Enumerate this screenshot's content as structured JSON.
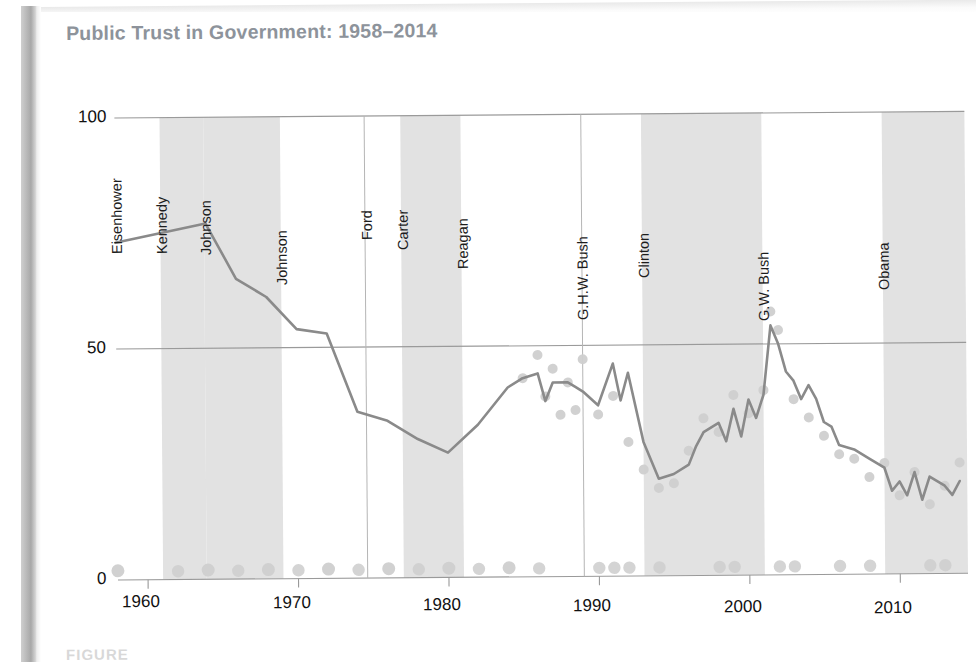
{
  "figure": {
    "title": "Public Trust in Government: 1958–2014",
    "caption": "FIGURE",
    "title_color": "#8d939b"
  },
  "chart_data": {
    "type": "line",
    "title": "Public Trust in Government: 1958–2014",
    "xlabel": "",
    "ylabel": "",
    "xlim": [
      1958,
      2014.5
    ],
    "ylim": [
      0,
      100
    ],
    "xticks": [
      "1960",
      "1970",
      "1980",
      "1990",
      "2000",
      "2010"
    ],
    "xtick_values": [
      1960,
      1970,
      1980,
      1990,
      2000,
      2010
    ],
    "yticks": [
      "0",
      "50",
      "100"
    ],
    "ytick_values": [
      0,
      50,
      100
    ],
    "grid": "horizontal",
    "legend": "none",
    "line_color": "#8a8a8a",
    "point_color": "#cfcfcf",
    "band_color": "#e2e2e2",
    "series": [
      {
        "name": "Trust the federal government to do what is right (moving average)",
        "x": [
          1958,
          1964,
          1966,
          1968,
          1970,
          1972,
          1974,
          1976,
          1978,
          1980,
          1982,
          1984,
          1985,
          1986,
          1986.5,
          1987,
          1988,
          1988.5,
          1989,
          1990,
          1991,
          1991.5,
          1992,
          1993,
          1994,
          1995,
          1996,
          1996.5,
          1997,
          1998,
          1998.5,
          1999,
          1999.5,
          2000,
          2000.5,
          2001,
          2001.5,
          2002,
          2002.5,
          2003,
          2003.5,
          2004,
          2004.5,
          2005,
          2005.5,
          2006,
          2007,
          2008,
          2009,
          2009.5,
          2010,
          2010.5,
          2011,
          2011.5,
          2012,
          2012.5,
          2013,
          2013.5,
          2014
        ],
        "values": [
          73,
          77,
          65,
          61,
          54,
          53,
          36,
          34,
          30,
          27,
          33,
          41,
          43,
          44,
          38,
          42,
          42,
          41,
          40,
          37,
          46,
          38,
          44,
          29,
          21,
          22,
          24,
          28,
          31,
          33,
          29,
          36,
          30,
          38,
          34,
          39,
          54,
          50,
          44,
          42,
          38,
          41,
          38,
          33,
          32,
          28,
          27,
          25,
          23,
          18,
          20,
          17,
          22,
          16,
          21,
          20,
          19,
          17,
          20
        ]
      },
      {
        "name": "Individual survey readings",
        "x": [
          1958,
          1964,
          1968,
          1972,
          1976,
          1980,
          1984,
          1985,
          1986,
          1986.5,
          1987,
          1987.5,
          1988,
          1988.5,
          1989,
          1990,
          1991,
          1992,
          1993,
          1994,
          1995,
          1996,
          1997,
          1998,
          1999,
          2000,
          2001,
          2001.5,
          2002,
          2003,
          2004,
          2005,
          2006,
          2007,
          2008,
          2009,
          2010,
          2011,
          2012,
          2013,
          2014
        ],
        "values": [
          2,
          2,
          2,
          2,
          2,
          2,
          2,
          43,
          48,
          39,
          45,
          35,
          42,
          36,
          47,
          35,
          39,
          29,
          23,
          19,
          20,
          27,
          34,
          31,
          39,
          35,
          40,
          57,
          53,
          38,
          34,
          30,
          26,
          25,
          21,
          24,
          17,
          22,
          15,
          19,
          24
        ]
      }
    ],
    "presidents": [
      {
        "label": "Eisenhower",
        "start": 1958,
        "end": 1961,
        "shaded": false
      },
      {
        "label": "Kennedy",
        "start": 1961,
        "end": 1963.9,
        "shaded": true
      },
      {
        "label": "Johnson",
        "start": 1963.9,
        "end": 1969,
        "shaded": true
      },
      {
        "label": "Johnson",
        "start": 1969,
        "end": 1974.6,
        "shaded": false
      },
      {
        "label": "Ford",
        "start": 1974.6,
        "end": 1977,
        "shaded": false
      },
      {
        "label": "Carter",
        "start": 1977,
        "end": 1981,
        "shaded": true
      },
      {
        "label": "Reagan",
        "start": 1981,
        "end": 1989,
        "shaded": false
      },
      {
        "label": "G.H.W. Bush",
        "start": 1989,
        "end": 1993,
        "shaded": false
      },
      {
        "label": "Clinton",
        "start": 1993,
        "end": 2001,
        "shaded": true
      },
      {
        "label": "G.W. Bush",
        "start": 2001,
        "end": 2009,
        "shaded": false
      },
      {
        "label": "Obama",
        "start": 2009,
        "end": 2014.5,
        "shaded": true
      }
    ]
  }
}
